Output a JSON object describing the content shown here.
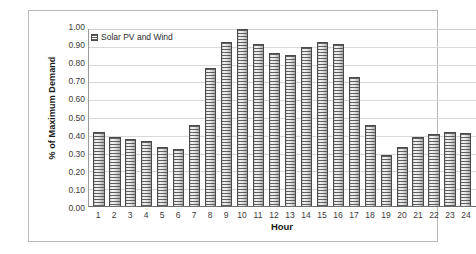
{
  "chart_data": {
    "type": "bar",
    "title": "",
    "xlabel": "Hour",
    "ylabel": "% of Maximum Demand",
    "categories": [
      "1",
      "2",
      "3",
      "4",
      "5",
      "6",
      "7",
      "8",
      "9",
      "10",
      "11",
      "12",
      "13",
      "14",
      "15",
      "16",
      "17",
      "18",
      "19",
      "20",
      "21",
      "22",
      "23",
      "24"
    ],
    "series": [
      {
        "name": "Solar PV and Wind",
        "values": [
          0.42,
          0.39,
          0.38,
          0.37,
          0.335,
          0.32,
          0.455,
          0.78,
          0.925,
          1.0,
          0.915,
          0.865,
          0.855,
          0.9,
          0.925,
          0.915,
          0.73,
          0.455,
          0.29,
          0.335,
          0.39,
          0.405,
          0.42,
          0.41
        ]
      }
    ],
    "ylim": [
      0.0,
      1.0
    ],
    "yticks": [
      "1.00",
      "0.90",
      "0.80",
      "0.70",
      "0.60",
      "0.50",
      "0.40",
      "0.30",
      "0.20",
      "0.10",
      "0.00"
    ],
    "grid": true,
    "legend_position": "top-left"
  },
  "legend": {
    "entries": [
      {
        "label": "Solar PV and Wind",
        "swatch": "hatched-bar-swatch"
      }
    ]
  }
}
